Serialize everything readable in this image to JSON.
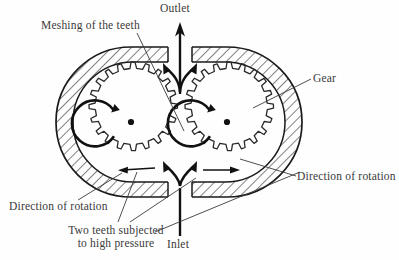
{
  "diagram": {
    "type": "external-gear-pump",
    "colors": {
      "background": "#fefefe",
      "stroke": "#1a1a1a",
      "text": "#3a3a3a",
      "hatch": "#1a1a1a"
    },
    "labels": {
      "meshing": "Meshing of the teeth",
      "outlet": "Outlet",
      "gear": "Gear",
      "direction_right": "Direction of rotation",
      "direction_left": "Direction of rotation",
      "two_teeth_line1": "Two teeth subjected",
      "two_teeth_line2": "to high pressure",
      "inlet": "Inlet"
    },
    "components": {
      "left_gear": {
        "name": "left-gear",
        "teeth": 16,
        "rotation": "counterclockwise",
        "center_x": 131,
        "center_y": 122
      },
      "right_gear": {
        "name": "right-gear",
        "teeth": 16,
        "rotation": "clockwise",
        "center_x": 227,
        "center_y": 122
      },
      "housing": {
        "name": "pump-housing",
        "style": "hatched-section"
      },
      "outlet_port": {
        "name": "outlet-port",
        "flow": "up"
      },
      "inlet_port": {
        "name": "inlet-port",
        "flow": "up"
      }
    }
  }
}
